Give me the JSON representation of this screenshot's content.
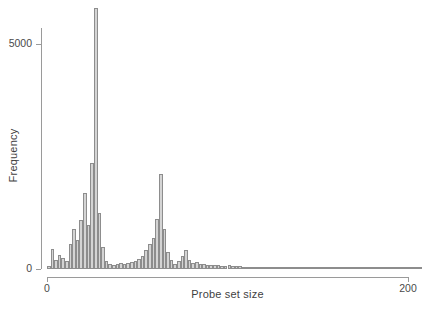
{
  "chart_data": {
    "type": "bar",
    "title": "",
    "subtitle": "",
    "xlabel": "Probe set size",
    "ylabel": "Frequency",
    "xlim": [
      0,
      208
    ],
    "ylim": [
      0,
      5800
    ],
    "grid": false,
    "legend": null,
    "bin_width": 2,
    "xticks": [
      0,
      200
    ],
    "xtick_labels": [
      "0",
      "200"
    ],
    "yticks": [
      0,
      5000
    ],
    "ytick_labels": [
      "0",
      "5000"
    ],
    "bar_fill": "#d4d4d4",
    "bar_edge": "#8d8d8d",
    "axis_color": "#9a9a9a",
    "text_color": "#4a4a4a",
    "x": [
      1,
      3,
      5,
      7,
      9,
      11,
      13,
      15,
      17,
      19,
      21,
      23,
      25,
      27,
      29,
      31,
      33,
      35,
      37,
      39,
      41,
      43,
      45,
      47,
      49,
      51,
      53,
      55,
      57,
      59,
      61,
      63,
      65,
      67,
      69,
      71,
      73,
      75,
      77,
      79,
      81,
      83,
      85,
      87,
      89,
      91,
      93,
      95,
      97,
      99,
      101,
      103,
      105,
      107,
      109,
      111,
      113,
      115,
      117,
      119,
      121,
      123,
      125,
      127,
      129,
      131,
      133,
      135,
      137,
      139,
      141,
      143,
      145,
      147,
      149,
      151,
      153,
      155,
      157,
      159,
      161,
      163,
      165,
      167,
      169,
      171,
      173,
      175,
      177,
      179,
      181,
      183,
      185,
      187,
      189,
      191,
      193,
      195,
      197,
      199,
      201,
      203,
      205,
      207
    ],
    "values": [
      70,
      440,
      200,
      320,
      250,
      180,
      560,
      900,
      640,
      1100,
      1700,
      980,
      2350,
      5800,
      1250,
      480,
      180,
      120,
      90,
      110,
      130,
      120,
      140,
      160,
      180,
      230,
      280,
      420,
      560,
      700,
      1120,
      2120,
      900,
      380,
      210,
      120,
      170,
      300,
      420,
      210,
      140,
      160,
      120,
      110,
      100,
      90,
      80,
      95,
      75,
      70,
      90,
      70,
      60,
      60,
      55,
      50,
      45,
      40,
      40,
      35,
      30,
      30,
      28,
      25,
      25,
      22,
      20,
      20,
      18,
      18,
      16,
      15,
      15,
      14,
      12,
      12,
      12,
      10,
      10,
      10,
      9,
      9,
      8,
      8,
      7,
      7,
      7,
      6,
      6,
      6,
      5,
      5,
      5,
      5,
      4,
      4,
      4,
      4,
      3,
      3,
      3,
      3,
      3,
      2
    ]
  }
}
